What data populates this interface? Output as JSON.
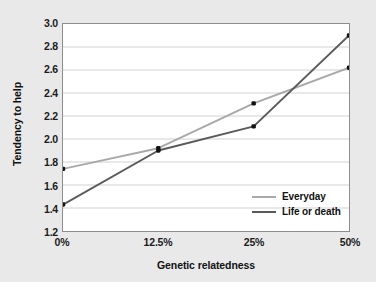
{
  "chart_data": {
    "type": "line",
    "title": "",
    "xlabel": "Genetic relatedness",
    "ylabel": "Tendency to help",
    "categories": [
      "0%",
      "12.5%",
      "25%",
      "50%"
    ],
    "series": [
      {
        "name": "Everyday",
        "color": "#a9a9a9",
        "values": [
          1.74,
          1.92,
          2.31,
          2.62
        ]
      },
      {
        "name": "Life or death",
        "color": "#5a5a5a",
        "values": [
          1.43,
          1.9,
          2.11,
          2.9
        ]
      }
    ],
    "ylim": [
      1.2,
      3.0
    ],
    "ytick_step": 0.2,
    "yticks": [
      "3.0",
      "2.8",
      "2.6",
      "2.4",
      "2.2",
      "2.0",
      "1.8",
      "1.6",
      "1.4",
      "1.2"
    ],
    "grid": "horizontal",
    "legend_position": "inside-bottom-right",
    "marker": "square-dot",
    "marker_color": "#111111",
    "background_color": "#e9e9e9",
    "plot_background_color": "#ffffff",
    "gridline_color": "#d0d0d0",
    "frame_color": "#8d8d8d"
  }
}
